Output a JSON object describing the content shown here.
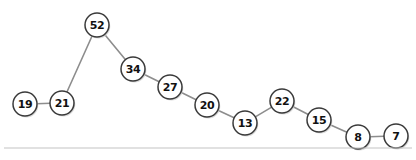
{
  "chart_data": {
    "type": "line",
    "title": "",
    "subtitle": "",
    "xlabel": "",
    "ylabel": "",
    "grid": false,
    "legend": null,
    "axis_visible": false,
    "node_shape": "circle",
    "node_labels_shown": true,
    "style_note": "hand-drawn sketch style line graph with value labels inside circular nodes",
    "categories": [
      "1",
      "2",
      "3",
      "4",
      "5",
      "6",
      "7",
      "8",
      "9",
      "10",
      "11"
    ],
    "values": [
      19,
      21,
      52,
      34,
      27,
      20,
      13,
      22,
      15,
      8,
      7
    ],
    "series": [
      {
        "name": "sequence",
        "values": [
          19,
          21,
          52,
          34,
          27,
          20,
          13,
          22,
          15,
          8,
          7
        ]
      }
    ],
    "points": [
      {
        "label": "19",
        "value": 19,
        "cx": 25,
        "cy": 104,
        "r": 12
      },
      {
        "label": "21",
        "value": 21,
        "cx": 62,
        "cy": 103,
        "r": 12
      },
      {
        "label": "52",
        "value": 52,
        "cx": 97,
        "cy": 25,
        "r": 12
      },
      {
        "label": "34",
        "value": 34,
        "cx": 133,
        "cy": 69,
        "r": 12
      },
      {
        "label": "27",
        "value": 27,
        "cx": 170,
        "cy": 87,
        "r": 12
      },
      {
        "label": "20",
        "value": 20,
        "cx": 207,
        "cy": 105,
        "r": 12
      },
      {
        "label": "13",
        "value": 13,
        "cx": 245,
        "cy": 123,
        "r": 12
      },
      {
        "label": "22",
        "value": 22,
        "cx": 282,
        "cy": 101,
        "r": 12
      },
      {
        "label": "15",
        "value": 15,
        "cx": 319,
        "cy": 120,
        "r": 12
      },
      {
        "label": "8",
        "value": 8,
        "cx": 358,
        "cy": 137,
        "r": 12
      },
      {
        "label": "7",
        "value": 7,
        "cx": 396,
        "cy": 136,
        "r": 12
      }
    ],
    "colors": {
      "background": "#ffffff",
      "node_fill": "#ffffff",
      "node_stroke": "#3a3a3a",
      "node_shadow": "#cfcfcf",
      "edge": "#8d8d8d",
      "label_text": "#111111",
      "baseline_rule": "#c4c4c4"
    },
    "ylim": [
      0,
      60
    ],
    "xlim": [
      0,
      12
    ],
    "min_value": 7,
    "max_value": 52,
    "point_count": 11
  },
  "baseline": {
    "y": 148,
    "x_start": 4,
    "x_end": 412
  }
}
